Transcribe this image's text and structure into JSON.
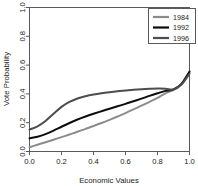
{
  "chart_data": {
    "type": "line",
    "title": "",
    "subtitle": "",
    "xlabel": "Economic Values",
    "ylabel": "Vote Probability",
    "xlim": [
      0.0,
      1.0
    ],
    "ylim": [
      0.0,
      1.0
    ],
    "grid": false,
    "legend_position": "top-right",
    "xticks": [
      "0.0",
      "0.2",
      "0.4",
      "0.6",
      "0.8",
      "1.0"
    ],
    "xtick_values": [
      0.0,
      0.2,
      0.4,
      0.6,
      0.8,
      1.0
    ],
    "yticks": [
      "0.0",
      "0.2",
      "0.4",
      "0.6",
      "0.8",
      "1.0"
    ],
    "ytick_values": [
      0.0,
      0.2,
      0.4,
      0.6,
      0.8,
      1.0
    ],
    "x": [
      0.0,
      0.05,
      0.1,
      0.15,
      0.2,
      0.25,
      0.3,
      0.35,
      0.4,
      0.45,
      0.5,
      0.55,
      0.6,
      0.65,
      0.7,
      0.75,
      0.8,
      0.85,
      0.9,
      0.95,
      1.0
    ],
    "series": [
      {
        "name": "1984",
        "color": "#8c8c8c",
        "values": [
          0.03,
          0.047,
          0.064,
          0.082,
          0.1,
          0.118,
          0.137,
          0.157,
          0.177,
          0.198,
          0.22,
          0.243,
          0.267,
          0.292,
          0.318,
          0.345,
          0.373,
          0.404,
          0.428,
          0.47,
          0.548
        ]
      },
      {
        "name": "1992",
        "color": "#0d0d0d",
        "values": [
          0.092,
          0.103,
          0.121,
          0.145,
          0.172,
          0.198,
          0.222,
          0.243,
          0.262,
          0.28,
          0.297,
          0.314,
          0.331,
          0.349,
          0.367,
          0.386,
          0.404,
          0.421,
          0.431,
          0.47,
          0.556
        ]
      },
      {
        "name": "1996",
        "color": "#4d4d4d",
        "values": [
          0.152,
          0.175,
          0.212,
          0.262,
          0.31,
          0.344,
          0.368,
          0.384,
          0.396,
          0.405,
          0.412,
          0.418,
          0.423,
          0.428,
          0.432,
          0.435,
          0.437,
          0.436,
          0.43,
          0.465,
          0.54
        ]
      }
    ]
  },
  "legend": {
    "items": [
      {
        "label": "1984",
        "color": "#8c8c8c"
      },
      {
        "label": "1992",
        "color": "#0d0d0d"
      },
      {
        "label": "1996",
        "color": "#4d4d4d"
      }
    ]
  }
}
